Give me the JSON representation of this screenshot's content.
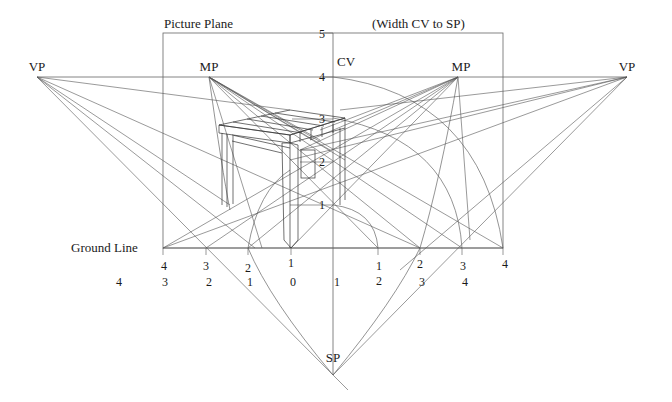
{
  "labels": {
    "picture_plane": "Picture Plane",
    "width_note": "(Width CV to SP)",
    "vp_left": "VP",
    "vp_right": "VP",
    "mp_left": "MP",
    "mp_right": "MP",
    "cv": "CV",
    "sp": "SP",
    "ground_line": "Ground Line"
  },
  "vertical_scale": [
    "5",
    "4",
    "3",
    "2",
    "1"
  ],
  "ground_ticks_top": {
    "left": [
      "4",
      "3",
      "2",
      "1"
    ],
    "right": [
      "1",
      "2",
      "3",
      "4"
    ]
  },
  "ground_ticks_bottom": [
    "4",
    "3",
    "2",
    "1",
    "0",
    "1",
    "2",
    "3",
    "4"
  ]
}
